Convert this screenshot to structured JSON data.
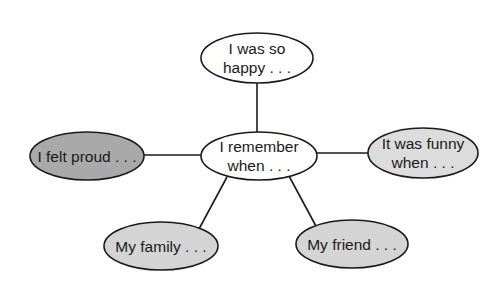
{
  "diagram": {
    "type": "concept-web",
    "center": {
      "id": "center",
      "lines": [
        "I remember",
        "when . . ."
      ],
      "fill": "#ffffff"
    },
    "nodes": [
      {
        "id": "top",
        "lines": [
          "I was so",
          "happy . . ."
        ],
        "fill": "#ffffff"
      },
      {
        "id": "left",
        "lines": [
          "I felt proud . . ."
        ],
        "fill": "#a9a9a9"
      },
      {
        "id": "right",
        "lines": [
          "It was funny",
          "when . . ."
        ],
        "fill": "#dcdcdc"
      },
      {
        "id": "bottom-left",
        "lines": [
          "My family . . ."
        ],
        "fill": "#d4d4d4"
      },
      {
        "id": "bottom-right",
        "lines": [
          "My friend . . ."
        ],
        "fill": "#d4d4d4"
      }
    ],
    "edges": [
      {
        "from": "center",
        "to": "top"
      },
      {
        "from": "center",
        "to": "left"
      },
      {
        "from": "center",
        "to": "right"
      },
      {
        "from": "center",
        "to": "bottom-left"
      },
      {
        "from": "center",
        "to": "bottom-right"
      }
    ]
  }
}
